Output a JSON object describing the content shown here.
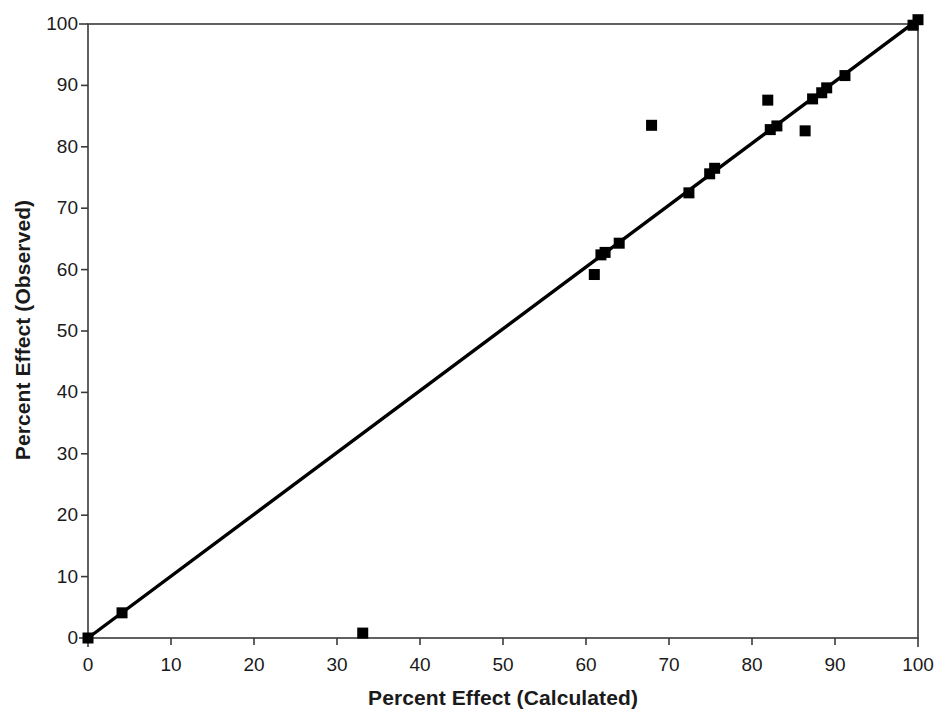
{
  "chart_data": {
    "type": "scatter",
    "title": "",
    "xlabel": "Percent Effect (Calculated)",
    "ylabel": "Percent Effect (Observed)",
    "xlim": [
      0,
      100
    ],
    "ylim": [
      0,
      100
    ],
    "xticks": [
      0,
      10,
      20,
      30,
      40,
      50,
      60,
      70,
      80,
      90,
      100
    ],
    "yticks": [
      0,
      10,
      20,
      30,
      40,
      50,
      60,
      70,
      80,
      90,
      100
    ],
    "xtick_labels": [
      "0",
      "10",
      "20",
      "30",
      "40",
      "50",
      "60",
      "70",
      "80",
      "90",
      "100"
    ],
    "ytick_labels": [
      "0",
      "10",
      "20",
      "30",
      "40",
      "50",
      "60",
      "70",
      "80",
      "90",
      "100"
    ],
    "grid": false,
    "legend": null,
    "marker": "filled-square",
    "marker_color": "#000000",
    "series": [
      {
        "name": "Observed vs Calculated",
        "points": [
          {
            "x": 0.0,
            "y": 0.0
          },
          {
            "x": 4.1,
            "y": 4.1
          },
          {
            "x": 33.1,
            "y": 0.8
          },
          {
            "x": 61.0,
            "y": 59.2
          },
          {
            "x": 61.8,
            "y": 62.4
          },
          {
            "x": 62.3,
            "y": 62.8
          },
          {
            "x": 64.0,
            "y": 64.3
          },
          {
            "x": 67.9,
            "y": 83.5
          },
          {
            "x": 72.4,
            "y": 72.5
          },
          {
            "x": 74.9,
            "y": 75.6
          },
          {
            "x": 75.5,
            "y": 76.5
          },
          {
            "x": 81.9,
            "y": 87.6
          },
          {
            "x": 82.2,
            "y": 82.8
          },
          {
            "x": 83.0,
            "y": 83.4
          },
          {
            "x": 86.4,
            "y": 82.6
          },
          {
            "x": 87.3,
            "y": 87.8
          },
          {
            "x": 88.4,
            "y": 88.8
          },
          {
            "x": 89.0,
            "y": 89.6
          },
          {
            "x": 91.2,
            "y": 91.6
          },
          {
            "x": 99.4,
            "y": 99.8
          },
          {
            "x": 100.0,
            "y": 100.7
          }
        ]
      }
    ],
    "reference_line": {
      "name": "identity-line",
      "from": {
        "x": 0,
        "y": 0
      },
      "to": {
        "x": 100,
        "y": 100.7
      },
      "color": "#000000"
    }
  },
  "axes": {
    "frame_color": "#3a3a3a",
    "tick_color": "#3a3a3a"
  }
}
